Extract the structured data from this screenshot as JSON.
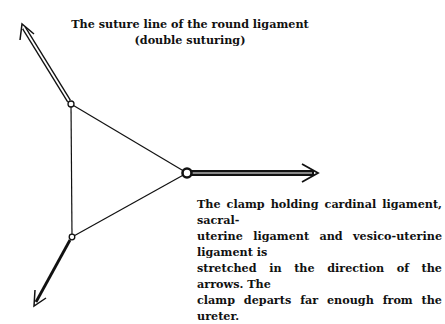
{
  "labels": {
    "suture_line": [
      "The suture line of the round ligament",
      "(double suturing)"
    ],
    "clamp_description": [
      "The clamp holding cardinal ligament, sacral-",
      "uterine ligament and vesico-uterine ligament is",
      "stretched in the direction of the arrows. The",
      "clamp departs far enough from the ureter."
    ]
  },
  "diagram": {
    "nodes": [
      "top-suture-node",
      "right-clamp-node",
      "bottom-node"
    ],
    "arrows": [
      "upper-left-arrow",
      "right-clamp-arrow",
      "lower-left-arrow"
    ],
    "line_color": "#111111"
  }
}
